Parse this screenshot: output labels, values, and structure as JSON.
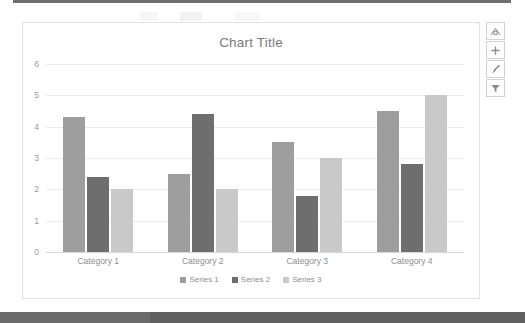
{
  "chart_data": {
    "type": "bar",
    "title": "Chart Title",
    "xlabel": "",
    "ylabel": "",
    "categories": [
      "Category 1",
      "Category 2",
      "Category 3",
      "Category 4"
    ],
    "series": [
      {
        "name": "Series 1",
        "color": "#9e9e9e",
        "values": [
          4.3,
          2.5,
          3.5,
          4.5
        ]
      },
      {
        "name": "Series 2",
        "color": "#6e6e6e",
        "values": [
          2.4,
          4.4,
          1.8,
          2.8
        ]
      },
      {
        "name": "Series 3",
        "color": "#c9c9c9",
        "values": [
          2.0,
          2.0,
          3.0,
          5.0
        ]
      }
    ],
    "ylim": [
      0,
      6
    ],
    "yticks": [
      0,
      1,
      2,
      3,
      4,
      5,
      6
    ],
    "grid": true,
    "legend_position": "bottom"
  },
  "side_buttons": [
    {
      "name": "chart-layout-button",
      "glyph": "layout"
    },
    {
      "name": "chart-elements-button",
      "glyph": "plus"
    },
    {
      "name": "chart-styles-button",
      "glyph": "brush"
    },
    {
      "name": "chart-filters-button",
      "glyph": "funnel"
    }
  ],
  "colors": {
    "series1": "#9e9e9e",
    "series2": "#6e6e6e",
    "series3": "#c9c9c9",
    "gridline": "#ebebeb",
    "text": "#8e8e8e",
    "frame_border": "#e2e2e2"
  }
}
